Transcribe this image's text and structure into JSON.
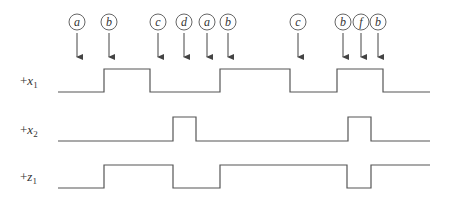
{
  "events": [
    {
      "label": "a",
      "x": 77
    },
    {
      "label": "b",
      "x": 109
    },
    {
      "label": "c",
      "x": 158
    },
    {
      "label": "d",
      "x": 184
    },
    {
      "label": "a",
      "x": 207
    },
    {
      "label": "b",
      "x": 228
    },
    {
      "label": "c",
      "x": 298
    },
    {
      "label": "b",
      "x": 343
    },
    {
      "label": "f",
      "x": 361
    },
    {
      "label": "b",
      "x": 378
    }
  ],
  "signals": [
    {
      "id": "x1",
      "prefix": "+",
      "var": "x",
      "sub": "1",
      "label_y": 85,
      "low_y": 92,
      "high_y": 69,
      "start_level": "low",
      "x_start": 58,
      "x_end": 430,
      "transitions": [
        104,
        150,
        220,
        290,
        337,
        383
      ]
    },
    {
      "id": "x2",
      "prefix": "+",
      "var": "x",
      "sub": "2",
      "label_y": 134,
      "low_y": 141,
      "high_y": 117,
      "start_level": "low",
      "x_start": 58,
      "x_end": 430,
      "transitions": [
        173,
        196,
        348,
        371
      ]
    },
    {
      "id": "z1",
      "prefix": "+",
      "var": "z",
      "sub": "1",
      "label_y": 181,
      "low_y": 188,
      "high_y": 165,
      "start_level": "low",
      "x_start": 58,
      "x_end": 430,
      "transitions": [
        104,
        173,
        220,
        347,
        371
      ]
    }
  ],
  "style": {
    "line_color": "#555555",
    "circle_radius": 8,
    "circle_y": 22,
    "arrow_top": 33,
    "arrow_bottom": 63
  }
}
